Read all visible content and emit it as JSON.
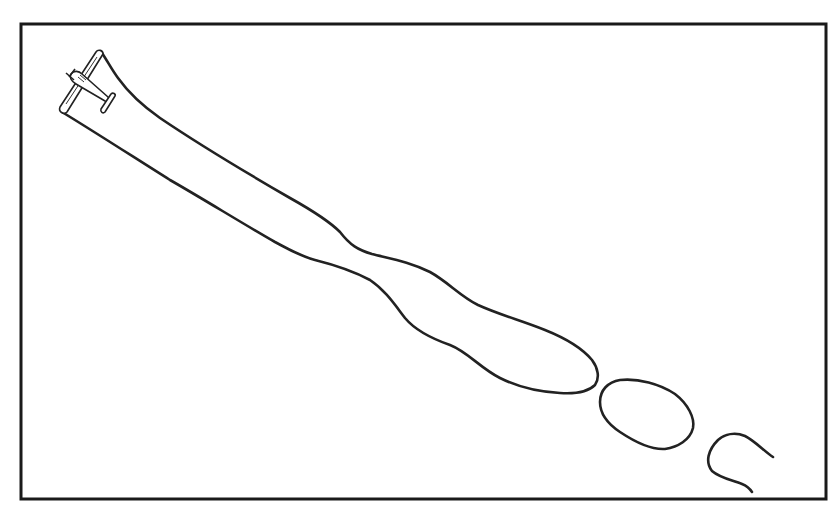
{
  "illustration": {
    "subject": "airplane with smoke trail breaking into puffs",
    "colors": {
      "background": "#ffffff",
      "ink": "#222222",
      "frame": "#1a1a1a"
    },
    "frame": {
      "x": 21,
      "y": 24,
      "width": 805,
      "height": 475
    },
    "elements": [
      {
        "name": "airplane",
        "position": "top-left"
      },
      {
        "name": "smoke-trail-main",
        "position": "diagonal from top-left to center-right"
      },
      {
        "name": "smoke-puff-oval",
        "position": "lower right"
      },
      {
        "name": "smoke-puff-open-curl",
        "position": "bottom right"
      }
    ]
  }
}
